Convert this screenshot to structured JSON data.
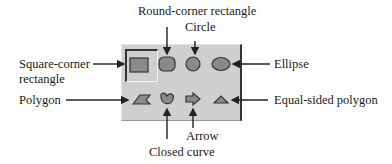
{
  "diagram": {
    "colors": {
      "palette_bg": "#cfcfcf",
      "shape_fill": "#8a8a8a",
      "line": "#222222"
    },
    "labels": {
      "round_corner_rectangle": "Round-corner rectangle",
      "circle": "Circle",
      "square_corner_rectangle_line1": "Square-corner",
      "square_corner_rectangle_line2": "rectangle",
      "ellipse": "Ellipse",
      "polygon": "Polygon",
      "equal_sided_polygon": "Equal-sided polygon",
      "arrow": "Arrow",
      "closed_curve": "Closed curve"
    },
    "tools": [
      {
        "row": 1,
        "col": 1,
        "name": "Square-corner rectangle",
        "selected": true
      },
      {
        "row": 1,
        "col": 2,
        "name": "Round-corner rectangle"
      },
      {
        "row": 1,
        "col": 3,
        "name": "Circle"
      },
      {
        "row": 1,
        "col": 4,
        "name": "Ellipse"
      },
      {
        "row": 2,
        "col": 1,
        "name": "Polygon"
      },
      {
        "row": 2,
        "col": 2,
        "name": "Closed curve"
      },
      {
        "row": 2,
        "col": 3,
        "name": "Arrow"
      },
      {
        "row": 2,
        "col": 4,
        "name": "Equal-sided polygon"
      }
    ]
  }
}
